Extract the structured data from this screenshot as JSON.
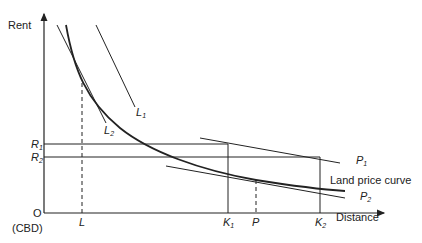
{
  "diagram": {
    "title": "",
    "axes": {
      "y_label": "Rent",
      "x_label": "Distance",
      "origin_label": "O",
      "origin_sublabel": "(CBD)"
    },
    "y_ticks": [
      {
        "name": "R",
        "sub": "1"
      },
      {
        "name": "R",
        "sub": "2"
      }
    ],
    "x_ticks": [
      {
        "name": "L",
        "sub": ""
      },
      {
        "name": "K",
        "sub": "1"
      },
      {
        "name": "P",
        "sub": ""
      },
      {
        "name": "K",
        "sub": "2"
      }
    ],
    "lines": [
      {
        "name": "L",
        "sub": "1"
      },
      {
        "name": "L",
        "sub": "2"
      },
      {
        "name": "P",
        "sub": "1"
      },
      {
        "name": "P",
        "sub": "2"
      }
    ],
    "curve_label": "Land price curve",
    "colors": {
      "ink": "#222222",
      "background": "#ffffff"
    }
  }
}
